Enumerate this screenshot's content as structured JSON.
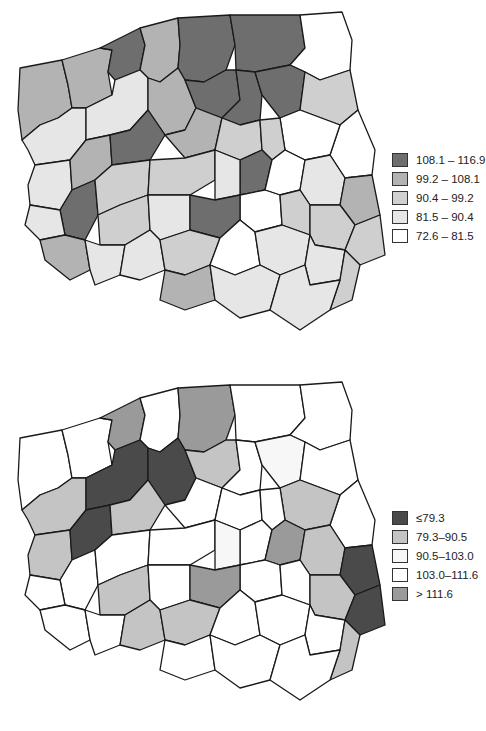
{
  "header": {
    "text": ""
  },
  "maps": [
    {
      "id": "top",
      "legend": [
        {
          "label": "108.1 – 116.9",
          "class": 0,
          "fill": "#6e6e6e"
        },
        {
          "label": "99.2 – 108.1",
          "class": 1,
          "fill": "#b3b3b3"
        },
        {
          "label": "90.4 – 99.2",
          "class": 2,
          "fill": "#cfcfcf"
        },
        {
          "label": "81.5 – 90.4",
          "class": 3,
          "fill": "#e6e6e6"
        },
        {
          "label": "72.6 – 81.5",
          "class": 4,
          "fill": "#ffffff"
        }
      ]
    },
    {
      "id": "bottom",
      "legend": [
        {
          "label": "≤79.3",
          "class": 0,
          "fill": "#4a4a4a"
        },
        {
          "label": "79.3–90.5",
          "class": 1,
          "fill": "#c4c4c4"
        },
        {
          "label": "90.5–103.0",
          "class": 2,
          "fill": "#f7f7f7"
        },
        {
          "label": "103.0–111.6",
          "class": 3,
          "fill": "#ffffff"
        },
        {
          "label": "> 111.6",
          "class": 4,
          "fill": "#9a9a9a"
        }
      ]
    }
  ],
  "regions_top": [
    1,
    1,
    0,
    1,
    0,
    0,
    4,
    3,
    3,
    1,
    0,
    0,
    0,
    2,
    4,
    4,
    3,
    1,
    0,
    1,
    2,
    2,
    0,
    4,
    3,
    1,
    0,
    2,
    2,
    3,
    3,
    4,
    2,
    2,
    2,
    2,
    3,
    0,
    1,
    3,
    3,
    2,
    4,
    3,
    3,
    2,
    1,
    3,
    3
  ],
  "regions_bottom": [
    3,
    3,
    4,
    3,
    4,
    3,
    3,
    1,
    0,
    0,
    1,
    3,
    2,
    3,
    3,
    1,
    1,
    0,
    1,
    3,
    3,
    3,
    3,
    4,
    1,
    0,
    3,
    3,
    3,
    2,
    3,
    3,
    3,
    1,
    0,
    1,
    3,
    4,
    3,
    3,
    1,
    1,
    3,
    3,
    3,
    1,
    3,
    3,
    3
  ]
}
